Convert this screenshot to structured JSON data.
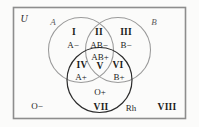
{
  "diagram": {
    "universe_label": "U",
    "set_labels": {
      "a": "A",
      "b": "B",
      "rh": "Rh"
    },
    "colors": {
      "background": "#fbfbfa",
      "frame_stroke": "#8d8d8d",
      "circle_a_stroke": "#9a9a9a",
      "circle_b_stroke": "#9a9a9a",
      "circle_rh_stroke": "#2b2b2b",
      "text": "#1b1b1b"
    },
    "regions": [
      {
        "id": "i",
        "roman": "I",
        "blood": "A−",
        "sets": "A only"
      },
      {
        "id": "ii",
        "roman": "II",
        "blood": "AB−",
        "sets": "A and B"
      },
      {
        "id": "iii",
        "roman": "III",
        "blood": "B−",
        "sets": "B only"
      },
      {
        "id": "iv",
        "roman": "IV",
        "blood": "A+",
        "sets": "A and Rh"
      },
      {
        "id": "v",
        "roman": "V",
        "blood": "AB+",
        "sets": "A and B and Rh"
      },
      {
        "id": "vi",
        "roman": "VI",
        "blood": "B+",
        "sets": "B and Rh"
      },
      {
        "id": "vii",
        "roman": "VII",
        "blood": "O+",
        "sets": "Rh only"
      },
      {
        "id": "viii",
        "roman": "VIII",
        "blood": "O−",
        "sets": "outside all sets"
      }
    ]
  }
}
